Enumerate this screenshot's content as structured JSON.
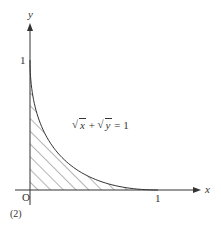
{
  "figure": {
    "label": "(2)",
    "origin_label": "O",
    "x_axis": {
      "label": "x",
      "tick_label": "1"
    },
    "y_axis": {
      "label": "y",
      "tick_label": "1"
    },
    "equation": {
      "term1": "x",
      "plus": "+",
      "term2": "y",
      "equals": "=",
      "rhs": "1",
      "text": "√x + √y = 1"
    },
    "region": "hatched region bounded by the curve and the axes",
    "colors": {
      "ink": "#333333",
      "background": "#ffffff"
    }
  },
  "chart_data": {
    "type": "line",
    "title": "",
    "xlabel": "x",
    "ylabel": "y",
    "xlim": [
      0,
      1.3
    ],
    "ylim": [
      0,
      1.3
    ],
    "series": [
      {
        "name": "√x + √y = 1",
        "x": [
          0,
          0.01,
          0.04,
          0.09,
          0.16,
          0.25,
          0.36,
          0.49,
          0.64,
          0.81,
          1
        ],
        "y": [
          1,
          0.81,
          0.64,
          0.49,
          0.36,
          0.25,
          0.16,
          0.09,
          0.04,
          0.01,
          0
        ]
      }
    ],
    "x_ticks": [
      "1"
    ],
    "y_ticks": [
      "1"
    ],
    "annotations": [
      "O",
      "(2)",
      "√x + √y = 1"
    ],
    "shaded_region": "area under curve from x=0 to x=1 (hatched)"
  }
}
